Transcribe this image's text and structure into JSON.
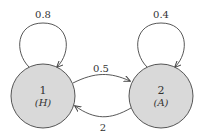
{
  "diagram": {
    "type": "state-transition",
    "colors": {
      "node_fill": "#d9d9d9",
      "stroke": "#444444",
      "text": "#333333"
    },
    "nodes": [
      {
        "id": "1",
        "label": "1",
        "sublabel": "(H)"
      },
      {
        "id": "2",
        "label": "2",
        "sublabel": "(A)"
      }
    ],
    "edges": [
      {
        "from": "1",
        "to": "1",
        "label": "0.8"
      },
      {
        "from": "2",
        "to": "2",
        "label": "0.4"
      },
      {
        "from": "1",
        "to": "2",
        "label": "0.5"
      },
      {
        "from": "2",
        "to": "1",
        "label": "2"
      }
    ]
  }
}
